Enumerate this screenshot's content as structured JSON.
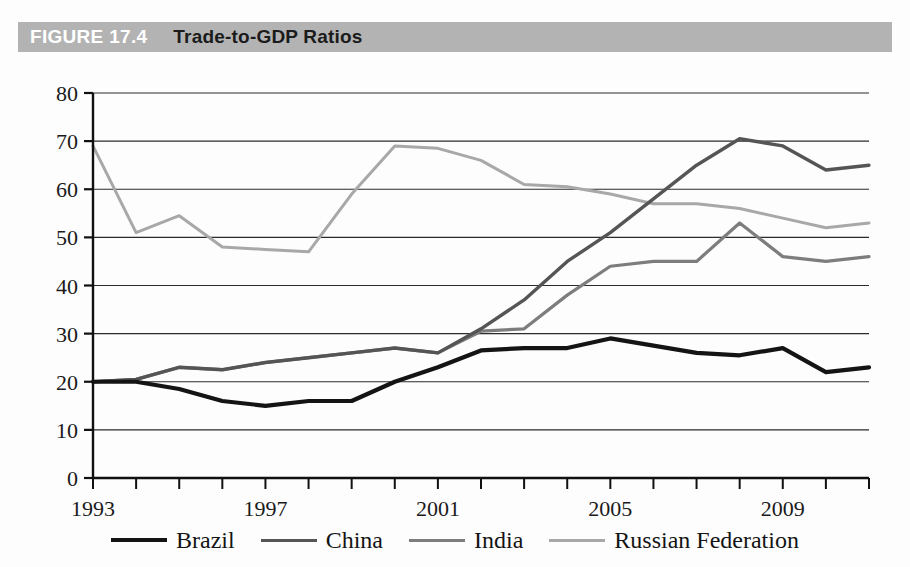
{
  "header": {
    "figure_number": "FIGURE 17.4",
    "title": "Trade-to-GDP Ratios",
    "band_color": "#b3b3b3",
    "number_color": "#ffffff",
    "title_color": "#1b1b1b"
  },
  "legend": {
    "position": "bottom",
    "items": [
      {
        "label": "Brazil",
        "color": "#141414",
        "width": 4.2
      },
      {
        "label": "China",
        "color": "#555555",
        "width": 3.4
      },
      {
        "label": "India",
        "color": "#7d7d7d",
        "width": 3.2
      },
      {
        "label": "Russian Federation",
        "color": "#a8a8a8",
        "width": 3.0
      }
    ]
  },
  "axes": {
    "y_ticks": [
      "0",
      "10",
      "20",
      "30",
      "40",
      "50",
      "60",
      "70",
      "80"
    ],
    "x_ticks_labeled": [
      "1993",
      "1997",
      "2001",
      "2005",
      "2009"
    ],
    "grid": true
  },
  "chart_data": {
    "type": "line",
    "title": "Trade-to-GDP Ratios",
    "xlabel": "",
    "ylabel": "",
    "xlim": [
      1993,
      2011
    ],
    "ylim": [
      0,
      80
    ],
    "ytick_step": 10,
    "grid": true,
    "legend_position": "bottom",
    "x": [
      1993,
      1994,
      1995,
      1996,
      1997,
      1998,
      1999,
      2000,
      2001,
      2002,
      2003,
      2004,
      2005,
      2006,
      2007,
      2008,
      2009,
      2010,
      2011
    ],
    "xtick_labels": [
      "1993",
      "",
      "",
      "",
      "1997",
      "",
      "",
      "",
      "2001",
      "",
      "",
      "",
      "2005",
      "",
      "",
      "",
      "2009",
      "",
      ""
    ],
    "series": [
      {
        "name": "Brazil",
        "color": "#141414",
        "values": [
          20,
          20,
          18.5,
          16,
          15,
          16,
          16,
          20,
          23,
          26.5,
          27,
          27,
          29,
          27.5,
          26,
          25.5,
          27,
          22,
          23
        ]
      },
      {
        "name": "China",
        "color": "#555555",
        "values": [
          20,
          20.5,
          23,
          22.5,
          24,
          25,
          26,
          27,
          26,
          31,
          37,
          45,
          51,
          58,
          65,
          70.5,
          69,
          64,
          65
        ]
      },
      {
        "name": "India",
        "color": "#7d7d7d",
        "values": [
          20,
          20.5,
          23,
          22.5,
          24,
          25,
          26,
          27,
          26,
          30.5,
          31,
          38,
          44,
          45,
          45,
          53,
          46,
          45,
          46
        ]
      },
      {
        "name": "Russian Federation",
        "color": "#a8a8a8",
        "values": [
          69,
          51,
          54.5,
          48,
          47.5,
          47,
          59,
          69,
          68.5,
          66,
          61,
          60.5,
          59,
          57,
          57,
          56,
          54,
          52,
          53
        ]
      }
    ]
  }
}
